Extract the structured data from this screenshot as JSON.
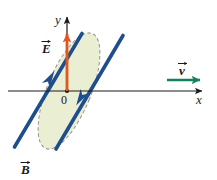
{
  "figure": {
    "background_color": "#ffffff"
  },
  "axes": {
    "x_label": "x",
    "y_label": "y",
    "origin_label": "0",
    "axis_color": "#1a1a1a",
    "x_axis": {
      "x1": 8,
      "y1": 91,
      "x2": 207,
      "y2": 91
    },
    "y_axis": {
      "x1": 67,
      "y1": 91,
      "x2": 67,
      "y2": 12
    }
  },
  "vectors": {
    "E": {
      "label": "E",
      "color": "#e2561f",
      "x1": 67,
      "y1": 91,
      "x2": 67,
      "y2": 29,
      "label_x": 47,
      "label_y": 50
    },
    "v": {
      "label": "v",
      "color": "#157f62",
      "x1": 167,
      "y1": 80,
      "x2": 205,
      "y2": 80,
      "label_x": 180,
      "label_y": 72
    },
    "B": {
      "label": "B",
      "color": "#1a1a1a",
      "label_x": 22,
      "label_y": 172
    }
  },
  "ellipse": {
    "fill_color": "#eaeed2",
    "border_color": "#8a8a80",
    "border_style": "dashed",
    "center_x": 69,
    "center_y": 91,
    "radius_x": 22,
    "radius_y": 62,
    "rotation_deg": 22
  },
  "field_lines": {
    "color": "#1f4e8c",
    "left_line": {
      "x1": 14,
      "y1": 148,
      "x2": 82,
      "y2": 33
    },
    "right_line": {
      "x1": 55,
      "y1": 150,
      "x2": 123,
      "y2": 35
    },
    "left_arrow_direction": "up-right",
    "right_arrow_direction": "down-left"
  }
}
